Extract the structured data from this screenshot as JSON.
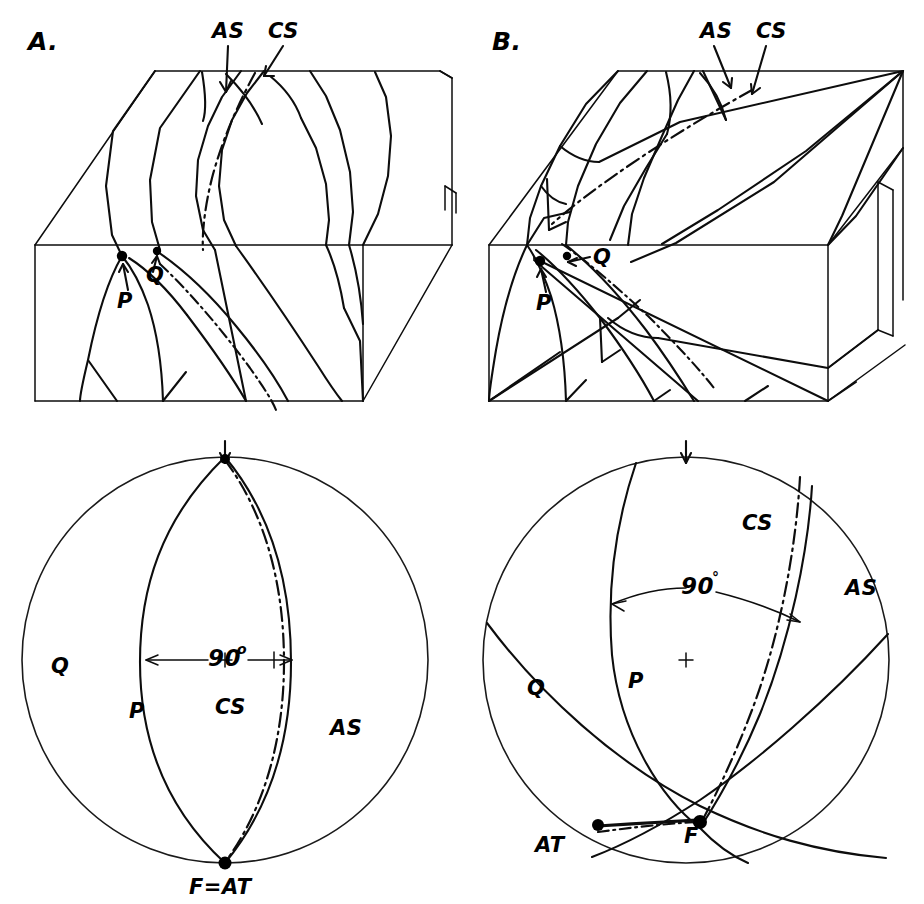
{
  "figure": {
    "background_color": "#ffffff",
    "ink_color": "#0d0d0d",
    "panel_count": 2
  },
  "panels": [
    {
      "id": "A",
      "label": "A.",
      "block": {
        "name": "block-diagram-a",
        "annotations": [
          {
            "key": "as",
            "text": "AS",
            "meaning": "axial-surface"
          },
          {
            "key": "cs",
            "text": "CS",
            "meaning": "cleavage-surface"
          },
          {
            "key": "p",
            "text": "P",
            "meaning": "fold-limb-p"
          },
          {
            "key": "q",
            "text": "Q",
            "meaning": "fold-limb-q"
          }
        ]
      },
      "stereonet": {
        "name": "stereonet-a",
        "center_marker": "+",
        "north_arrow": "down-arrow",
        "angle_label": "90",
        "angle_degree_symbol": "o",
        "labels": [
          {
            "key": "q",
            "text": "Q"
          },
          {
            "key": "p",
            "text": "P"
          },
          {
            "key": "cs",
            "text": "CS"
          },
          {
            "key": "as",
            "text": "AS"
          },
          {
            "key": "f_at",
            "text": "F=AT"
          }
        ]
      }
    },
    {
      "id": "B",
      "label": "B.",
      "block": {
        "name": "block-diagram-b",
        "annotations": [
          {
            "key": "as",
            "text": "AS",
            "meaning": "axial-surface"
          },
          {
            "key": "cs",
            "text": "CS",
            "meaning": "cleavage-surface"
          },
          {
            "key": "p",
            "text": "P",
            "meaning": "fold-limb-p"
          },
          {
            "key": "q",
            "text": "Q",
            "meaning": "fold-limb-q"
          }
        ]
      },
      "stereonet": {
        "name": "stereonet-b",
        "center_marker": "+",
        "north_arrow": "down-arrow",
        "angle_label": "90",
        "angle_degree_symbol": "°",
        "labels": [
          {
            "key": "cs",
            "text": "CS"
          },
          {
            "key": "as",
            "text": "AS"
          },
          {
            "key": "q",
            "text": "Q"
          },
          {
            "key": "p",
            "text": "P"
          },
          {
            "key": "at",
            "text": "AT"
          },
          {
            "key": "f",
            "text": "F"
          }
        ]
      }
    }
  ],
  "legend_keys": {
    "AS": "axial surface",
    "CS": "cleavage surface",
    "P": "limb P",
    "Q": "limb Q",
    "F": "fold axis",
    "AT": "axis of transport"
  }
}
